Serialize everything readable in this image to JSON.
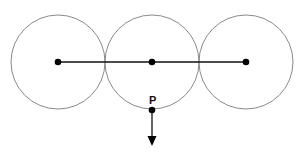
{
  "diagram": {
    "circles": [
      {
        "cx": 58,
        "cy": 62,
        "r": 47
      },
      {
        "cx": 152,
        "cy": 62,
        "r": 47
      },
      {
        "cx": 246,
        "cy": 62,
        "r": 47
      }
    ],
    "center_line": {
      "x1": 58,
      "y1": 62,
      "x2": 246,
      "y2": 62
    },
    "point_p": {
      "label": "P",
      "x": 152,
      "y": 110
    },
    "arrow": {
      "x": 152,
      "y_start": 110,
      "y_end": 146,
      "direction": "down"
    },
    "colors": {
      "circle": "#8a8a8a",
      "line": "#111111",
      "dot": "#000000"
    }
  }
}
